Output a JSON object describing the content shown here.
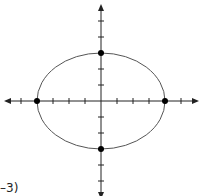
{
  "diagram": {
    "type": "ellipse-on-coordinate-plane",
    "equation": "x^2/16 + y^2/9 = 1",
    "center": [
      0,
      0
    ],
    "semi_axis_x": 4,
    "semi_axis_y": 3,
    "x_ticks": [
      -5,
      -4,
      -3,
      -2,
      -1,
      1,
      2,
      3,
      4,
      5
    ],
    "y_ticks": [
      -5,
      -4,
      -3,
      -2,
      -1,
      1,
      2,
      3,
      4,
      5
    ],
    "points": [
      {
        "label": "(-4, 0)",
        "x": -4,
        "y": 0
      },
      {
        "label": "(4, 0)",
        "x": 4,
        "y": 0
      },
      {
        "label": "(0, 3)",
        "x": 0,
        "y": 3
      },
      {
        "label": "(0, -3)",
        "x": 0,
        "y": -3
      }
    ],
    "colors": {
      "axis": "#222222",
      "curve": "#555555",
      "point": "#000000"
    }
  },
  "caption": {
    "partial_text": "–3)"
  }
}
